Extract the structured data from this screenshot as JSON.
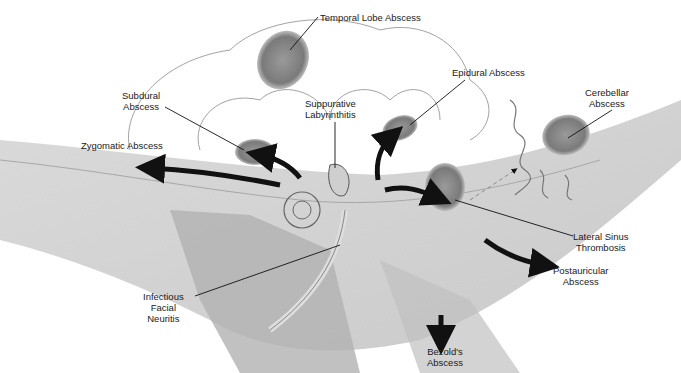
{
  "diagram": {
    "labels": {
      "temporal_lobe_abscess": "Temporal Lobe Abscess",
      "epidural_abscess": "Epidural Abscess",
      "subdural_abscess": "Subdural\nAbscess",
      "suppurative_labyrinthitis": "Suppurative\nLabyrinthitis",
      "cerebellar_abscess": "Cerebellar\nAbscess",
      "zygomatic_abscess": "Zygomatic Abscess",
      "lateral_sinus_thrombosis": "Lateral Sinus\nThrombosis",
      "infectious_facial_neuritis": "Infectious\nFacial\nNeuritis",
      "postauricular_abscess": "Postauricular\nAbscess",
      "bezolds_abscess": "Bezold's\nAbscess"
    }
  }
}
